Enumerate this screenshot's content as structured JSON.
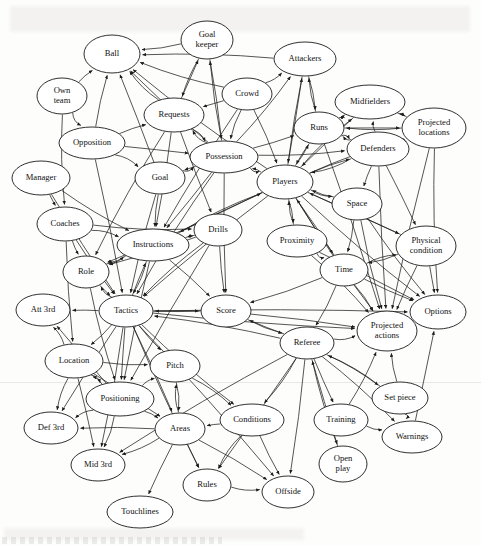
{
  "figure": {
    "type": "directed-graph",
    "title": "",
    "node_count": 40,
    "edge_count": 154,
    "style": {
      "node_shape": "ellipse",
      "node_fill": "#ffffff",
      "node_stroke": "#1a1a1a",
      "edge_stroke": "#1d1d1d",
      "arrowheads": "filled-triangle",
      "background": "#fdfdfc"
    }
  },
  "nodes": [
    {
      "id": "goalkeeper",
      "label": "Goal\nkeeper",
      "label_lines": [
        "Goal",
        "keeper"
      ],
      "x": 207,
      "y": 40,
      "rx": 26,
      "ry": 19
    },
    {
      "id": "ball",
      "label": "Ball",
      "label_lines": [
        "Ball"
      ],
      "x": 112,
      "y": 54,
      "rx": 28,
      "ry": 19
    },
    {
      "id": "attackers",
      "label": "Attackers",
      "label_lines": [
        "Attackers"
      ],
      "x": 305,
      "y": 59,
      "rx": 31,
      "ry": 17
    },
    {
      "id": "ownteam",
      "label": "Own\nteam",
      "label_lines": [
        "Own",
        "team"
      ],
      "x": 62,
      "y": 96,
      "rx": 25,
      "ry": 18
    },
    {
      "id": "crowd",
      "label": "Crowd",
      "label_lines": [
        "Crowd"
      ],
      "x": 247,
      "y": 94,
      "rx": 25,
      "ry": 16
    },
    {
      "id": "midfielders",
      "label": "Midfielders",
      "label_lines": [
        "Midfielders"
      ],
      "x": 370,
      "y": 102,
      "rx": 35,
      "ry": 17
    },
    {
      "id": "requests",
      "label": "Requests",
      "label_lines": [
        "Requests"
      ],
      "x": 174,
      "y": 115,
      "rx": 30,
      "ry": 17
    },
    {
      "id": "runs",
      "label": "Runs",
      "label_lines": [
        "Runs"
      ],
      "x": 319,
      "y": 128,
      "rx": 25,
      "ry": 16
    },
    {
      "id": "projloc",
      "label": "Projected\nlocations",
      "label_lines": [
        "Projected",
        "locations"
      ],
      "x": 434,
      "y": 128,
      "rx": 32,
      "ry": 20
    },
    {
      "id": "opposition",
      "label": "Opposition",
      "label_lines": [
        "Opposition"
      ],
      "x": 92,
      "y": 143,
      "rx": 33,
      "ry": 16
    },
    {
      "id": "possession",
      "label": "Possession",
      "label_lines": [
        "Possession"
      ],
      "x": 224,
      "y": 157,
      "rx": 34,
      "ry": 16
    },
    {
      "id": "defenders",
      "label": "Defenders",
      "label_lines": [
        "Defenders"
      ],
      "x": 378,
      "y": 149,
      "rx": 31,
      "ry": 17
    },
    {
      "id": "manager",
      "label": "Manager",
      "label_lines": [
        "Manager"
      ],
      "x": 41,
      "y": 178,
      "rx": 29,
      "ry": 17
    },
    {
      "id": "goal",
      "label": "Goal",
      "label_lines": [
        "Goal"
      ],
      "x": 160,
      "y": 178,
      "rx": 25,
      "ry": 16
    },
    {
      "id": "players",
      "label": "Players",
      "label_lines": [
        "Players"
      ],
      "x": 285,
      "y": 182,
      "rx": 28,
      "ry": 17
    },
    {
      "id": "space",
      "label": "Space",
      "label_lines": [
        "Space"
      ],
      "x": 357,
      "y": 204,
      "rx": 25,
      "ry": 16
    },
    {
      "id": "coaches",
      "label": "Coaches",
      "label_lines": [
        "Coaches"
      ],
      "x": 65,
      "y": 224,
      "rx": 28,
      "ry": 17
    },
    {
      "id": "drills",
      "label": "Drills",
      "label_lines": [
        "Drills"
      ],
      "x": 218,
      "y": 230,
      "rx": 24,
      "ry": 16
    },
    {
      "id": "physcond",
      "label": "Physical\ncondition",
      "label_lines": [
        "Physical",
        "condition"
      ],
      "x": 426,
      "y": 246,
      "rx": 30,
      "ry": 20
    },
    {
      "id": "instructions",
      "label": "Instructions",
      "label_lines": [
        "Instructions"
      ],
      "x": 153,
      "y": 245,
      "rx": 36,
      "ry": 16
    },
    {
      "id": "proximity",
      "label": "Proximity",
      "label_lines": [
        "Proximity"
      ],
      "x": 297,
      "y": 241,
      "rx": 30,
      "ry": 16
    },
    {
      "id": "role",
      "label": "Role",
      "label_lines": [
        "Role"
      ],
      "x": 86,
      "y": 272,
      "rx": 23,
      "ry": 16
    },
    {
      "id": "time",
      "label": "Time",
      "label_lines": [
        "Time"
      ],
      "x": 344,
      "y": 270,
      "rx": 24,
      "ry": 16
    },
    {
      "id": "att3rd",
      "label": "Att 3rd",
      "label_lines": [
        "Att 3rd"
      ],
      "x": 43,
      "y": 310,
      "rx": 27,
      "ry": 16
    },
    {
      "id": "tactics",
      "label": "Tactics",
      "label_lines": [
        "Tactics"
      ],
      "x": 126,
      "y": 311,
      "rx": 27,
      "ry": 16
    },
    {
      "id": "score",
      "label": "Score",
      "label_lines": [
        "Score"
      ],
      "x": 226,
      "y": 311,
      "rx": 25,
      "ry": 16
    },
    {
      "id": "options",
      "label": "Options",
      "label_lines": [
        "Options"
      ],
      "x": 438,
      "y": 312,
      "rx": 28,
      "ry": 17
    },
    {
      "id": "projact",
      "label": "Projected\nactions",
      "label_lines": [
        "Projected",
        "actions"
      ],
      "x": 387,
      "y": 331,
      "rx": 30,
      "ry": 20
    },
    {
      "id": "referee",
      "label": "Referee",
      "label_lines": [
        "Referee"
      ],
      "x": 307,
      "y": 343,
      "rx": 27,
      "ry": 16
    },
    {
      "id": "location",
      "label": "Location",
      "label_lines": [
        "Location"
      ],
      "x": 74,
      "y": 361,
      "rx": 29,
      "ry": 17
    },
    {
      "id": "pitch",
      "label": "Pitch",
      "label_lines": [
        "Pitch"
      ],
      "x": 175,
      "y": 366,
      "rx": 25,
      "ry": 16
    },
    {
      "id": "setpiece",
      "label": "Set piece",
      "label_lines": [
        "Set piece"
      ],
      "x": 400,
      "y": 398,
      "rx": 28,
      "ry": 16
    },
    {
      "id": "positioning",
      "label": "Positioning",
      "label_lines": [
        "Positioning"
      ],
      "x": 120,
      "y": 399,
      "rx": 34,
      "ry": 17
    },
    {
      "id": "conditions",
      "label": "Conditions",
      "label_lines": [
        "Conditions"
      ],
      "x": 252,
      "y": 420,
      "rx": 32,
      "ry": 16
    },
    {
      "id": "training",
      "label": "Training",
      "label_lines": [
        "Training"
      ],
      "x": 341,
      "y": 420,
      "rx": 27,
      "ry": 16
    },
    {
      "id": "def3rd",
      "label": "Def 3rd",
      "label_lines": [
        "Def 3rd"
      ],
      "x": 51,
      "y": 428,
      "rx": 27,
      "ry": 16
    },
    {
      "id": "areas",
      "label": "Areas",
      "label_lines": [
        "Areas"
      ],
      "x": 180,
      "y": 429,
      "rx": 25,
      "ry": 16
    },
    {
      "id": "warnings",
      "label": "Warnings",
      "label_lines": [
        "Warnings"
      ],
      "x": 412,
      "y": 437,
      "rx": 30,
      "ry": 16
    },
    {
      "id": "mid3rd",
      "label": "Mid 3rd",
      "label_lines": [
        "Mid 3rd"
      ],
      "x": 98,
      "y": 465,
      "rx": 27,
      "ry": 16
    },
    {
      "id": "openplay",
      "label": "Open\nplay",
      "label_lines": [
        "Open",
        "play"
      ],
      "x": 343,
      "y": 464,
      "rx": 24,
      "ry": 18
    },
    {
      "id": "rules",
      "label": "Rules",
      "label_lines": [
        "Rules"
      ],
      "x": 207,
      "y": 485,
      "rx": 24,
      "ry": 16
    },
    {
      "id": "offside",
      "label": "Offside",
      "label_lines": [
        "Offside"
      ],
      "x": 288,
      "y": 492,
      "rx": 26,
      "ry": 16
    },
    {
      "id": "touchlines",
      "label": "Touchlines",
      "label_lines": [
        "Touchlines"
      ],
      "x": 140,
      "y": 512,
      "rx": 33,
      "ry": 16
    }
  ],
  "edges": [
    [
      "goalkeeper",
      "ball"
    ],
    [
      "goalkeeper",
      "requests"
    ],
    [
      "goalkeeper",
      "possession"
    ],
    [
      "attackers",
      "ball"
    ],
    [
      "crowd",
      "ball"
    ],
    [
      "crowd",
      "requests"
    ],
    [
      "crowd",
      "possession"
    ],
    [
      "crowd",
      "players"
    ],
    [
      "crowd",
      "instructions"
    ],
    [
      "crowd",
      "attackers"
    ],
    [
      "ownteam",
      "ball"
    ],
    [
      "ownteam",
      "coaches"
    ],
    [
      "ownteam",
      "opposition"
    ],
    [
      "opposition",
      "ball"
    ],
    [
      "opposition",
      "requests"
    ],
    [
      "opposition",
      "goal"
    ],
    [
      "opposition",
      "possession"
    ],
    [
      "opposition",
      "tactics"
    ],
    [
      "requests",
      "ball"
    ],
    [
      "requests",
      "goalkeeper"
    ],
    [
      "requests",
      "possession"
    ],
    [
      "requests",
      "role"
    ],
    [
      "requests",
      "instructions"
    ],
    [
      "requests",
      "drills"
    ],
    [
      "possession",
      "ball"
    ],
    [
      "possession",
      "requests"
    ],
    [
      "possession",
      "goal"
    ],
    [
      "possession",
      "players"
    ],
    [
      "possession",
      "runs"
    ],
    [
      "possession",
      "defenders"
    ],
    [
      "possession",
      "attackers"
    ],
    [
      "possession",
      "goalkeeper"
    ],
    [
      "possession",
      "tactics"
    ],
    [
      "possession",
      "instructions"
    ],
    [
      "possession",
      "score"
    ],
    [
      "goal",
      "ball"
    ],
    [
      "goal",
      "possession"
    ],
    [
      "goal",
      "instructions"
    ],
    [
      "goal",
      "tactics"
    ],
    [
      "players",
      "ball"
    ],
    [
      "players",
      "possession"
    ],
    [
      "players",
      "runs"
    ],
    [
      "players",
      "space"
    ],
    [
      "players",
      "defenders"
    ],
    [
      "players",
      "midfielders"
    ],
    [
      "players",
      "attackers"
    ],
    [
      "players",
      "proximity"
    ],
    [
      "players",
      "time"
    ],
    [
      "players",
      "instructions"
    ],
    [
      "players",
      "physcond"
    ],
    [
      "players",
      "projact"
    ],
    [
      "players",
      "options"
    ],
    [
      "players",
      "role"
    ],
    [
      "players",
      "tactics"
    ],
    [
      "players",
      "projloc"
    ],
    [
      "runs",
      "midfielders"
    ],
    [
      "runs",
      "attackers"
    ],
    [
      "runs",
      "defenders"
    ],
    [
      "runs",
      "players"
    ],
    [
      "runs",
      "projloc"
    ],
    [
      "runs",
      "projact"
    ],
    [
      "defenders",
      "runs"
    ],
    [
      "defenders",
      "midfielders"
    ],
    [
      "defenders",
      "players"
    ],
    [
      "defenders",
      "space"
    ],
    [
      "defenders",
      "projloc"
    ],
    [
      "defenders",
      "physcond"
    ],
    [
      "defenders",
      "projact"
    ],
    [
      "midfielders",
      "runs"
    ],
    [
      "midfielders",
      "players"
    ],
    [
      "midfielders",
      "projloc"
    ],
    [
      "attackers",
      "runs"
    ],
    [
      "attackers",
      "players"
    ],
    [
      "projloc",
      "runs"
    ],
    [
      "projloc",
      "midfielders"
    ],
    [
      "projloc",
      "options"
    ],
    [
      "projloc",
      "projact"
    ],
    [
      "space",
      "players"
    ],
    [
      "space",
      "projact"
    ],
    [
      "space",
      "options"
    ],
    [
      "space",
      "time"
    ],
    [
      "manager",
      "coaches"
    ],
    [
      "manager",
      "instructions"
    ],
    [
      "manager",
      "tactics"
    ],
    [
      "coaches",
      "instructions"
    ],
    [
      "coaches",
      "role"
    ],
    [
      "coaches",
      "tactics"
    ],
    [
      "coaches",
      "drills"
    ],
    [
      "coaches",
      "location"
    ],
    [
      "instructions",
      "role"
    ],
    [
      "instructions",
      "tactics"
    ],
    [
      "instructions",
      "drills"
    ],
    [
      "instructions",
      "players"
    ],
    [
      "instructions",
      "score"
    ],
    [
      "instructions",
      "positioning"
    ],
    [
      "drills",
      "instructions"
    ],
    [
      "drills",
      "tactics"
    ],
    [
      "drills",
      "score"
    ],
    [
      "drills",
      "role"
    ],
    [
      "drills",
      "positioning"
    ],
    [
      "proximity",
      "players"
    ],
    [
      "proximity",
      "projact"
    ],
    [
      "proximity",
      "options"
    ],
    [
      "proximity",
      "time"
    ],
    [
      "time",
      "projact"
    ],
    [
      "time",
      "options"
    ],
    [
      "time",
      "score"
    ],
    [
      "time",
      "physcond"
    ],
    [
      "time",
      "players"
    ],
    [
      "time",
      "referee"
    ],
    [
      "physcond",
      "projact"
    ],
    [
      "physcond",
      "options"
    ],
    [
      "physcond",
      "players"
    ],
    [
      "physcond",
      "time"
    ],
    [
      "role",
      "tactics"
    ],
    [
      "role",
      "instructions"
    ],
    [
      "role",
      "positioning"
    ],
    [
      "tactics",
      "att3rd"
    ],
    [
      "tactics",
      "role"
    ],
    [
      "tactics",
      "score"
    ],
    [
      "tactics",
      "location"
    ],
    [
      "tactics",
      "pitch"
    ],
    [
      "tactics",
      "positioning"
    ],
    [
      "tactics",
      "areas"
    ],
    [
      "tactics",
      "def3rd"
    ],
    [
      "tactics",
      "mid3rd"
    ],
    [
      "tactics",
      "instructions"
    ],
    [
      "tactics",
      "projact"
    ],
    [
      "tactics",
      "options"
    ],
    [
      "tactics",
      "rules"
    ],
    [
      "tactics",
      "offside"
    ],
    [
      "tactics",
      "conditions"
    ],
    [
      "score",
      "tactics"
    ],
    [
      "score",
      "projact"
    ],
    [
      "score",
      "referee"
    ],
    [
      "referee",
      "projact"
    ],
    [
      "referee",
      "warnings"
    ],
    [
      "referee",
      "conditions"
    ],
    [
      "referee",
      "rules"
    ],
    [
      "referee",
      "offside"
    ],
    [
      "referee",
      "training"
    ],
    [
      "referee",
      "openplay"
    ],
    [
      "referee",
      "setpiece"
    ],
    [
      "referee",
      "mid3rd"
    ],
    [
      "referee",
      "tactics"
    ],
    [
      "referee",
      "score"
    ],
    [
      "location",
      "att3rd"
    ],
    [
      "location",
      "def3rd"
    ],
    [
      "location",
      "mid3rd"
    ],
    [
      "location",
      "pitch"
    ],
    [
      "location",
      "positioning"
    ],
    [
      "location",
      "areas"
    ],
    [
      "positioning",
      "att3rd"
    ],
    [
      "positioning",
      "location"
    ],
    [
      "positioning",
      "mid3rd"
    ],
    [
      "positioning",
      "pitch"
    ],
    [
      "positioning",
      "areas"
    ],
    [
      "positioning",
      "def3rd"
    ],
    [
      "areas",
      "mid3rd"
    ],
    [
      "areas",
      "def3rd"
    ],
    [
      "areas",
      "rules"
    ],
    [
      "areas",
      "offside"
    ],
    [
      "areas",
      "touchlines"
    ],
    [
      "areas",
      "pitch"
    ],
    [
      "conditions",
      "rules"
    ],
    [
      "conditions",
      "offside"
    ],
    [
      "conditions",
      "areas"
    ],
    [
      "training",
      "projact"
    ],
    [
      "training",
      "warnings"
    ],
    [
      "setpiece",
      "projact"
    ],
    [
      "setpiece",
      "warnings"
    ],
    [
      "setpiece",
      "referee"
    ],
    [
      "warnings",
      "options"
    ],
    [
      "rules",
      "offside"
    ],
    [
      "openplay",
      "referee"
    ],
    [
      "pitch",
      "areas"
    ],
    [
      "pitch",
      "conditions"
    ]
  ]
}
